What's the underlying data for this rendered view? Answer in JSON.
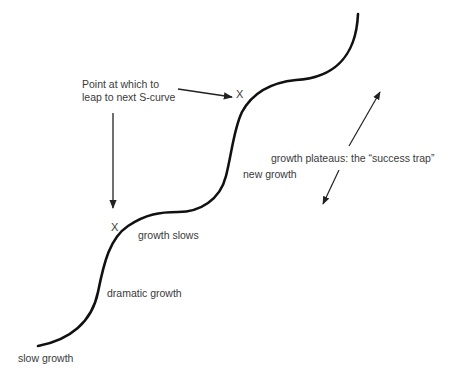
{
  "diagram": {
    "type": "s-curve-growth",
    "colors": {
      "background": "#ffffff",
      "curve": "#111111",
      "arrow": "#222222",
      "text": "#3a3a3a"
    },
    "labels": {
      "leap_line1": "Point at which to",
      "leap_line2": "leap to next S-curve",
      "new_growth": "new growth",
      "plateau": "growth plateaus: the “success trap”",
      "growth_slows": "growth slows",
      "dramatic_growth": "dramatic growth",
      "slow_growth": "slow growth"
    },
    "markers": {
      "upper_x": "X",
      "lower_x": "X"
    },
    "stages": [
      "slow growth",
      "dramatic growth",
      "growth slows",
      "new growth",
      "growth plateaus: the “success trap”"
    ]
  }
}
